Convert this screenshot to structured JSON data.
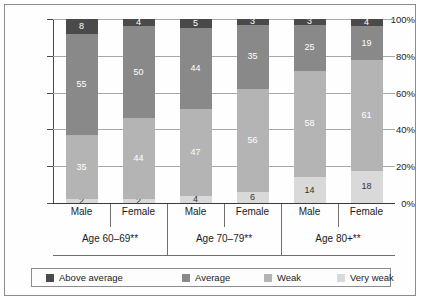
{
  "chart_data": {
    "type": "bar",
    "subtype": "100-percent-stacked",
    "title": "",
    "xlabel": "",
    "ylabel": "",
    "ylim": [
      0,
      100
    ],
    "ytick_labels": [
      "0%",
      "20%",
      "40%",
      "60%",
      "80%",
      "100%"
    ],
    "ytick_values": [
      0,
      20,
      40,
      60,
      80,
      100
    ],
    "grid": true,
    "legend_position": "bottom",
    "categories": [
      "Male",
      "Female",
      "Male",
      "Female",
      "Male",
      "Female"
    ],
    "groups": [
      {
        "label": "Age 60–69**",
        "categories": [
          "Male",
          "Female"
        ]
      },
      {
        "label": "Age 70–79**",
        "categories": [
          "Male",
          "Female"
        ]
      },
      {
        "label": "Age 80+**",
        "categories": [
          "Male",
          "Female"
        ]
      }
    ],
    "series": [
      {
        "name": "Above average",
        "color": "#4a4a4a",
        "label_color": "#ffffff",
        "values": [
          8,
          4,
          5,
          3,
          3,
          4
        ]
      },
      {
        "name": "Average",
        "color": "#898989",
        "label_color": "#ffffff",
        "values": [
          55,
          50,
          44,
          35,
          25,
          19
        ]
      },
      {
        "name": "Weak",
        "color": "#b4b4b4",
        "label_color": "#ffffff",
        "values": [
          35,
          44,
          47,
          56,
          58,
          61
        ]
      },
      {
        "name": "Very weak",
        "color": "#d9d9d9",
        "label_color": "#333333",
        "values": [
          2,
          2,
          4,
          6,
          14,
          18
        ]
      }
    ],
    "bars": [
      {
        "group": "Age 60–69**",
        "category": "Male",
        "above_average": 8,
        "average": 55,
        "weak": 35,
        "very_weak": 2
      },
      {
        "group": "Age 60–69**",
        "category": "Female",
        "above_average": 4,
        "average": 50,
        "weak": 44,
        "very_weak": 2
      },
      {
        "group": "Age 70–79**",
        "category": "Male",
        "above_average": 5,
        "average": 44,
        "weak": 47,
        "very_weak": 4
      },
      {
        "group": "Age 70–79**",
        "category": "Female",
        "above_average": 3,
        "average": 35,
        "weak": 56,
        "very_weak": 6
      },
      {
        "group": "Age 80+**",
        "category": "Male",
        "above_average": 3,
        "average": 25,
        "weak": 58,
        "very_weak": 14
      },
      {
        "group": "Age 80+**",
        "category": "Female",
        "above_average": 4,
        "average": 19,
        "weak": 61,
        "very_weak": 18
      }
    ]
  },
  "legend": {
    "items": [
      {
        "label": "Above average",
        "color": "#4a4a4a"
      },
      {
        "label": "Average",
        "color": "#898989"
      },
      {
        "label": "Weak",
        "color": "#b4b4b4"
      },
      {
        "label": "Very weak",
        "color": "#d9d9d9"
      }
    ]
  },
  "colors": {
    "above_average": "#4a4a4a",
    "average": "#898989",
    "weak": "#b4b4b4",
    "very_weak": "#d9d9d9",
    "axis": "#4a4a4a",
    "grid": "#a8a8a8",
    "border": "#8c8c8c",
    "background": "#ffffff"
  }
}
